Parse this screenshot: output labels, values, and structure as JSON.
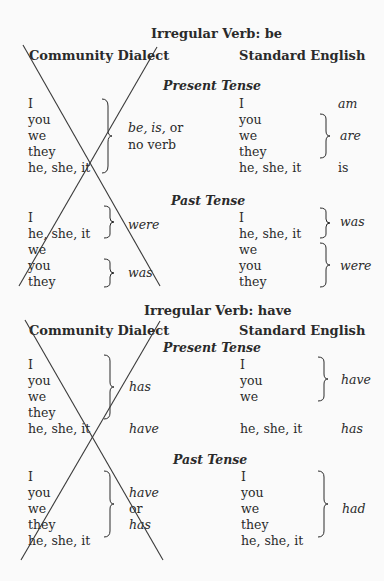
{
  "be": {
    "title": "Irregular Verb: be",
    "left_header": "Community Dialect",
    "right_header": "Standard English",
    "present": {
      "label": "Present Tense",
      "dialect_pronouns": [
        "I",
        "you",
        "we",
        "they",
        "he, she, it"
      ],
      "dialect_form_1": "be, is,",
      "dialect_form_or": " or",
      "dialect_form_2": "no verb",
      "standard_rows": [
        {
          "pronoun": "I",
          "verb": "am"
        },
        {
          "pronoun": "you"
        },
        {
          "pronoun": "we",
          "verb": "are"
        },
        {
          "pronoun": "they"
        },
        {
          "pronoun": "he, she, it",
          "verb": "is"
        }
      ]
    },
    "past": {
      "label": "Past Tense",
      "dialect_pronouns": [
        "I",
        "he, she, it",
        "we",
        "you",
        "they"
      ],
      "dialect_forms": [
        "were",
        "was"
      ],
      "standard_pronouns": [
        "I",
        "he, she, it",
        "we",
        "you",
        "they"
      ],
      "standard_forms": [
        "was",
        "were"
      ]
    }
  },
  "have": {
    "title": "Irregular Verb: have",
    "left_header": "Community Dialect",
    "right_header": "Standard English",
    "present": {
      "label": "Present Tense",
      "dialect_pronouns": [
        "I",
        "you",
        "we",
        "they",
        "he, she, it"
      ],
      "dialect_forms": [
        "has",
        "have"
      ],
      "standard_pronouns": [
        "I",
        "you",
        "we",
        "he, she, it"
      ],
      "standard_forms": [
        "have",
        "has"
      ]
    },
    "past": {
      "label": "Past Tense",
      "dialect_pronouns": [
        "I",
        "you",
        "we",
        "they",
        "he, she, it"
      ],
      "dialect_forms": [
        "have",
        "or",
        "has"
      ],
      "standard_pronouns": [
        "I",
        "you",
        "we",
        "they",
        "he, she, it"
      ],
      "standard_form": "had"
    }
  },
  "colors": {
    "text": "#2a2a2a",
    "strike": "#3a3a3a",
    "background": "#fafafa"
  }
}
